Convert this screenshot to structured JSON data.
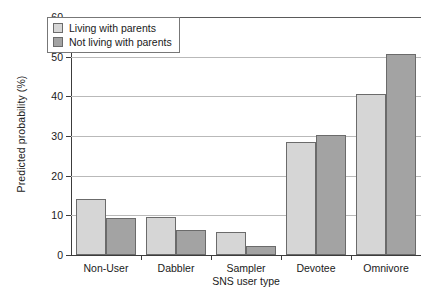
{
  "chart_data": {
    "type": "bar",
    "title": "",
    "xlabel": "SNS user type",
    "ylabel": "Predicted probability (%)",
    "categories": [
      "Non-User",
      "Dabbler",
      "Sampler",
      "Devotee",
      "Omnivore"
    ],
    "series": [
      {
        "name": "Living with parents",
        "color": "#d6d6d6",
        "values": [
          14.0,
          9.7,
          5.8,
          28.4,
          40.7
        ]
      },
      {
        "name": "Not living with parents",
        "color": "#a3a3a3",
        "values": [
          9.3,
          6.2,
          2.2,
          30.2,
          50.8
        ]
      }
    ],
    "ylim": [
      0,
      60
    ],
    "yticks": [
      0,
      10,
      20,
      30,
      40,
      50,
      60
    ],
    "ytick_labels": [
      "0",
      "10",
      "20",
      "30",
      "40",
      "50",
      "60"
    ],
    "grid": true,
    "legend_position": "top-left"
  }
}
